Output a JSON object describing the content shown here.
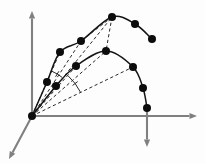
{
  "figure": {
    "background_color": "#fdfdfd",
    "width": 205,
    "height": 164,
    "axis_color": "#808080",
    "curve_color": "#141414",
    "dash_color": "#2a2a2a",
    "marker_color": "#0c0c0c"
  },
  "origin": {
    "label": "origin",
    "x": 32,
    "y": 116,
    "radius": 4.0
  },
  "axes": [
    {
      "name": "vertical-axis",
      "orientation": "up",
      "x1": 32,
      "y1": 116,
      "x2": 32,
      "y2": 11,
      "arrow": true
    },
    {
      "name": "horizontal-axis",
      "orientation": "right",
      "x1": 32,
      "y1": 116,
      "x2": 197,
      "y2": 116,
      "arrow": true
    },
    {
      "name": "depth-axis",
      "orientation": "down-left",
      "x1": 32,
      "y1": 116,
      "x2": 9,
      "y2": 159,
      "arrow": true
    },
    {
      "name": "impact-drop-axis",
      "orientation": "down",
      "x1": 147,
      "y1": 108,
      "x2": 147,
      "y2": 147,
      "arrow": true
    }
  ],
  "chart_data": {
    "type": "scatter",
    "xlabel": "",
    "ylabel": "",
    "grid": false,
    "legend": "none",
    "xlim": [
      32,
      197
    ],
    "ylim": [
      164,
      0
    ],
    "series": [
      {
        "name": "upper-trajectory",
        "type": "line",
        "points": [
          {
            "x": 32,
            "y": 116
          },
          {
            "x": 47,
            "y": 82
          },
          {
            "x": 60,
            "y": 52
          },
          {
            "x": 81,
            "y": 41
          },
          {
            "x": 112,
            "y": 17
          },
          {
            "x": 135,
            "y": 24
          },
          {
            "x": 152,
            "y": 39
          }
        ],
        "marker_points": [
          {
            "x": 47,
            "y": 82
          },
          {
            "x": 60,
            "y": 52
          },
          {
            "x": 81,
            "y": 41
          },
          {
            "x": 112,
            "y": 17
          },
          {
            "x": 135,
            "y": 24
          },
          {
            "x": 152,
            "y": 39
          }
        ]
      },
      {
        "name": "lower-trajectory",
        "type": "line",
        "points": [
          {
            "x": 32,
            "y": 116
          },
          {
            "x": 56,
            "y": 86
          },
          {
            "x": 76,
            "y": 66
          },
          {
            "x": 106,
            "y": 51
          },
          {
            "x": 133,
            "y": 67
          },
          {
            "x": 143,
            "y": 88
          },
          {
            "x": 147,
            "y": 108
          }
        ],
        "marker_points": [
          {
            "x": 56,
            "y": 86
          },
          {
            "x": 76,
            "y": 66
          },
          {
            "x": 106,
            "y": 51
          },
          {
            "x": 133,
            "y": 67
          },
          {
            "x": 143,
            "y": 88
          },
          {
            "x": 147,
            "y": 108
          }
        ]
      }
    ],
    "radial_vectors": [
      {
        "name": "radial-to-upper-p1",
        "x1": 32,
        "y1": 116,
        "x2": 60,
        "y2": 52
      },
      {
        "name": "radial-to-upper-p2",
        "x1": 32,
        "y1": 116,
        "x2": 81,
        "y2": 41
      },
      {
        "name": "radial-to-apex",
        "x1": 32,
        "y1": 116,
        "x2": 112,
        "y2": 17
      },
      {
        "name": "radial-to-lower-p1",
        "x1": 32,
        "y1": 116,
        "x2": 76,
        "y2": 66
      },
      {
        "name": "radial-to-lower-apex",
        "x1": 32,
        "y1": 116,
        "x2": 106,
        "y2": 51
      },
      {
        "name": "radial-to-lower-p3",
        "x1": 32,
        "y1": 116,
        "x2": 133,
        "y2": 67
      },
      {
        "name": "chord-apex-to-upper-p2",
        "x1": 112,
        "y1": 17,
        "x2": 81,
        "y2": 41
      },
      {
        "name": "chord-apex-to-lower-apex",
        "x1": 112,
        "y1": 17,
        "x2": 106,
        "y2": 51
      }
    ],
    "angle_arcs": [
      {
        "name": "angle-arc-upper",
        "cx": 32,
        "cy": 116,
        "radius": 49,
        "start_deg": 52,
        "end_deg": 66
      },
      {
        "name": "angle-arc-lower",
        "cx": 32,
        "cy": 116,
        "radius": 54,
        "start_deg": 26,
        "end_deg": 48
      }
    ]
  }
}
